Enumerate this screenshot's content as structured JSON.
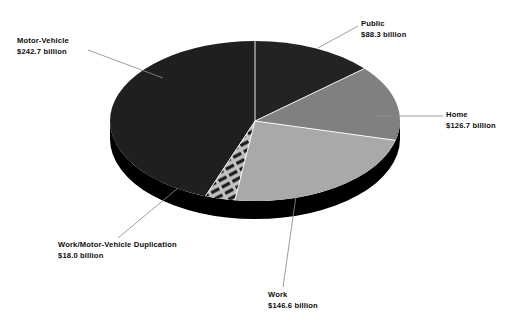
{
  "chart_data": {
    "type": "pie",
    "title": "",
    "subtitle": "",
    "xlabel": "",
    "ylabel": "",
    "legend_position": "callout-labels",
    "grid": false,
    "style": "3d-exploded-none",
    "unit": "billion US dollars",
    "total": 586.3,
    "categories": [
      "Motor-Vehicle",
      "Public",
      "Home",
      "Work",
      "Work/Motor-Vehicle Duplication"
    ],
    "values": [
      242.7,
      88.3,
      126.7,
      146.6,
      18.0
    ],
    "value_labels": [
      "$242.7 billion",
      "$88.3 billion",
      "$126.7 billion",
      "$146.6 billion",
      "$18.0 billion"
    ],
    "slices": [
      {
        "name": "Motor-Vehicle",
        "value": 242.7,
        "value_label": "$242.7 billion",
        "fill": "#1f1f1f",
        "pattern": "solid",
        "start_angle": 200.0,
        "end_angle": 360.0
      },
      {
        "name": "Public",
        "value": 88.3,
        "value_label": "$88.3 billion",
        "fill": "#232323",
        "pattern": "solid",
        "start_angle": 0.0,
        "end_angle": 49.0
      },
      {
        "name": "Home",
        "value": 126.7,
        "value_label": "$126.7 billion",
        "fill": "#808080",
        "pattern": "solid",
        "start_angle": 49.0,
        "end_angle": 104.0
      },
      {
        "name": "Work",
        "value": 146.6,
        "value_label": "$146.6 billion",
        "fill": "#a9a9a9",
        "pattern": "solid",
        "start_angle": 104.0,
        "end_angle": 188.0
      },
      {
        "name": "Work/Motor-Vehicle Duplication",
        "value": 18.0,
        "value_label": "$18.0 billion",
        "fill": "#b4b4b4",
        "pattern": "horizontal-stripes",
        "start_angle": 188.0,
        "end_angle": 200.0
      }
    ],
    "geometry": {
      "center_x": 255,
      "center_y": 121,
      "radius_x": 145,
      "radius_y": 80,
      "depth": 18,
      "side_fill": "#000000"
    },
    "colors": {
      "background": "#ffffff",
      "text": "#0d0d0d",
      "leader_line": "#8c8c8c",
      "slice_divider": "#ffffff"
    }
  },
  "labels": {
    "motor_vehicle": {
      "category": "Motor-Vehicle",
      "value": "$242.7 billion"
    },
    "public": {
      "category": "Public",
      "value": "$88.3 billion"
    },
    "home": {
      "category": "Home",
      "value": "$126.7 billion"
    },
    "work": {
      "category": "Work",
      "value": "$146.6 billion"
    },
    "duplication": {
      "category": "Work/Motor-Vehicle Duplication",
      "value": "$18.0 billion"
    }
  }
}
